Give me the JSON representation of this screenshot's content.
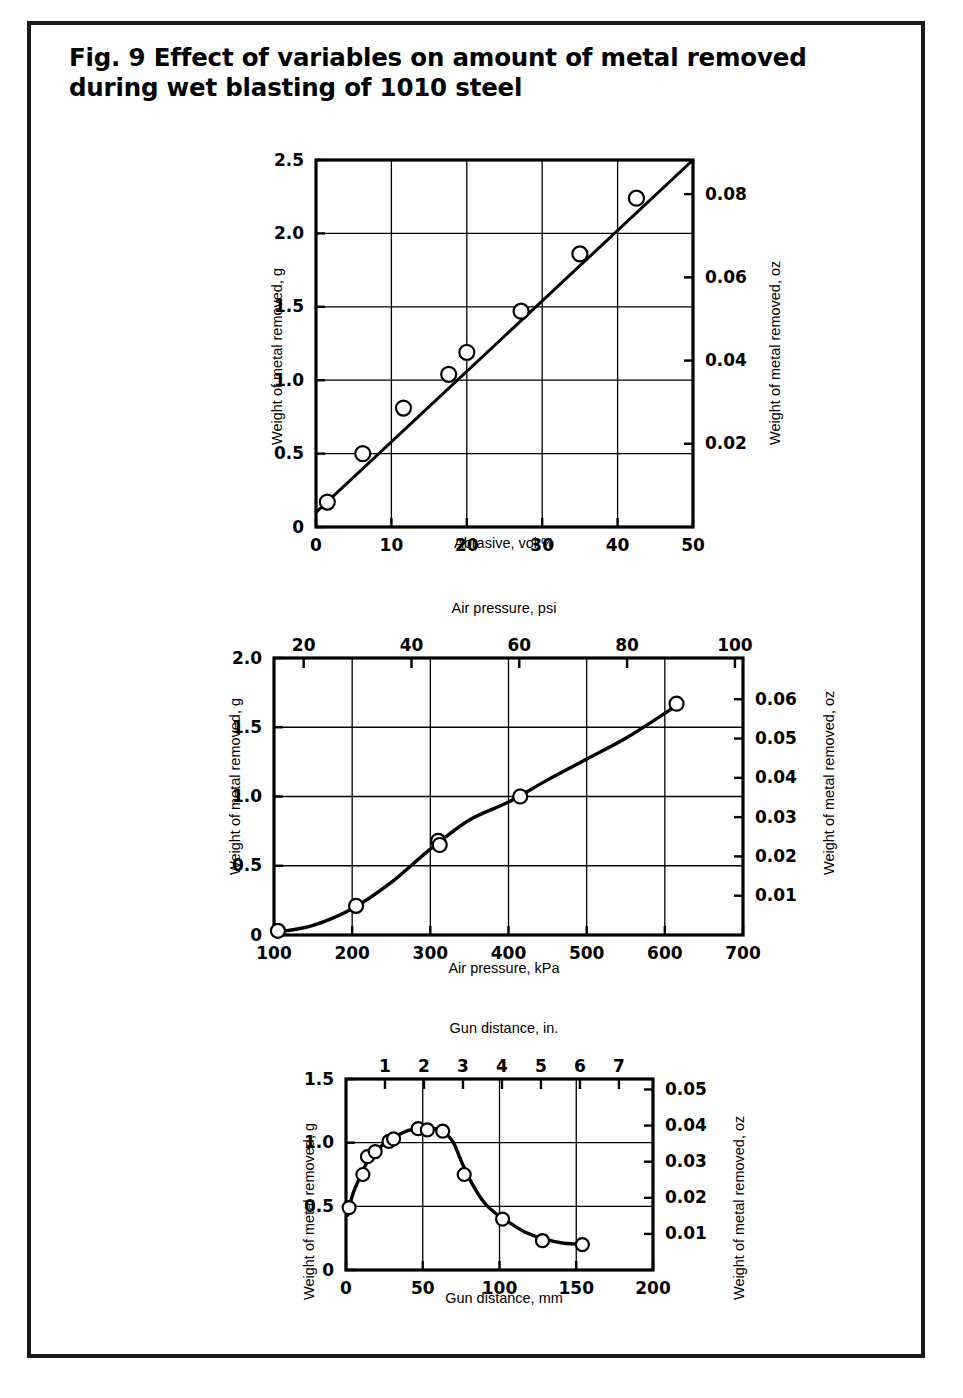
{
  "figure": {
    "title": "Fig. 9 Effect of variables on amount of metal removed during wet blasting of 1010 steel",
    "title_line1": "Fig. 9 Effect of variables on amount of metal removed",
    "title_line2": "during wet blasting of 1010 steel"
  },
  "chart_data": [
    {
      "type": "line",
      "id": "abrasive-chart",
      "title": "",
      "xlabel": "Abrasive, vol %",
      "ylabel": "Weight of metal removed, g",
      "y2label": "Weight of metal removed, oz",
      "xlim": [
        0,
        50
      ],
      "ylim": [
        0,
        2.5
      ],
      "y2lim": [
        0,
        0.0882
      ],
      "xticks": [
        0,
        10,
        20,
        30,
        40,
        50
      ],
      "xtick_labels": [
        "0",
        "10",
        "20",
        "30",
        "40",
        "50"
      ],
      "yticks": [
        0,
        0.5,
        1.0,
        1.5,
        2.0,
        2.5
      ],
      "ytick_labels": [
        "0",
        "0.5",
        "1.0",
        "1.5",
        "2.0",
        "2.5"
      ],
      "y2ticks": [
        0.02,
        0.04,
        0.06,
        0.08
      ],
      "y2tick_labels": [
        "0.02",
        "0.04",
        "0.06",
        "0.08"
      ],
      "grid": true,
      "x": [
        1.5,
        6.2,
        11.6,
        17.6,
        20.0,
        27.2,
        35.0,
        42.5
      ],
      "y": [
        0.17,
        0.5,
        0.81,
        1.04,
        1.19,
        1.47,
        1.86,
        2.24
      ],
      "fit_line": [
        [
          0,
          0.1
        ],
        [
          50,
          2.5
        ]
      ],
      "marker": "open-circle"
    },
    {
      "type": "line",
      "id": "air-pressure-chart",
      "title": "",
      "xlabel": "Air pressure, kPa",
      "xlabel_top": "Air pressure, psi",
      "ylabel": "Weight of metal removed, g",
      "y2label": "Weight of metal removed, oz",
      "xlim": [
        100,
        700
      ],
      "xlim_top": [
        14.5,
        101.5
      ],
      "ylim": [
        0,
        2.0
      ],
      "y2lim": [
        0,
        0.0705
      ],
      "xticks": [
        100,
        200,
        300,
        400,
        500,
        600,
        700
      ],
      "xtick_labels": [
        "100",
        "200",
        "300",
        "400",
        "500",
        "600",
        "700"
      ],
      "xticks_top": [
        20,
        40,
        60,
        80,
        100
      ],
      "xtick_labels_top": [
        "20",
        "40",
        "60",
        "80",
        "100"
      ],
      "yticks": [
        0,
        0.5,
        1.0,
        1.5,
        2.0
      ],
      "ytick_labels": [
        "0",
        "0.5",
        "1.0",
        "1.5",
        "2.0"
      ],
      "y2ticks": [
        0.01,
        0.02,
        0.03,
        0.04,
        0.05,
        0.06
      ],
      "y2tick_labels": [
        "0.01",
        "0.02",
        "0.03",
        "0.04",
        "0.05",
        "0.06"
      ],
      "grid": true,
      "x": [
        105,
        205,
        310,
        312,
        415,
        615
      ],
      "y": [
        0.03,
        0.21,
        0.68,
        0.65,
        1.0,
        1.67
      ],
      "curve": [
        [
          104,
          0.02
        ],
        [
          150,
          0.07
        ],
        [
          200,
          0.19
        ],
        [
          250,
          0.38
        ],
        [
          300,
          0.62
        ],
        [
          350,
          0.83
        ],
        [
          400,
          0.96
        ],
        [
          450,
          1.12
        ],
        [
          500,
          1.27
        ],
        [
          550,
          1.42
        ],
        [
          600,
          1.6
        ],
        [
          617,
          1.67
        ]
      ],
      "marker": "open-circle"
    },
    {
      "type": "line",
      "id": "gun-distance-chart",
      "title": "",
      "xlabel": "Gun distance, mm",
      "xlabel_top": "Gun distance, in.",
      "ylabel": "Weight of metal removed, g",
      "y2label": "Weight of metal removed, oz",
      "xlim": [
        0,
        200
      ],
      "xlim_top": [
        0,
        7.874
      ],
      "ylim": [
        0,
        1.5
      ],
      "y2lim": [
        0,
        0.0529
      ],
      "xticks": [
        0,
        50,
        100,
        150,
        200
      ],
      "xtick_labels": [
        "0",
        "50",
        "100",
        "150",
        "200"
      ],
      "xticks_top": [
        1,
        2,
        3,
        4,
        5,
        6,
        7
      ],
      "xtick_labels_top": [
        "1",
        "2",
        "3",
        "4",
        "5",
        "6",
        "7"
      ],
      "yticks": [
        0,
        0.5,
        1.0,
        1.5
      ],
      "ytick_labels": [
        "0",
        "0.5",
        "1.0",
        "1.5"
      ],
      "y2ticks": [
        0.01,
        0.02,
        0.03,
        0.04,
        0.05
      ],
      "y2tick_labels": [
        "0.01",
        "0.02",
        "0.03",
        "0.04",
        "0.05"
      ],
      "grid": true,
      "x": [
        2,
        11,
        14,
        19,
        28,
        31,
        47,
        53,
        63,
        77,
        102,
        128,
        154
      ],
      "y": [
        0.49,
        0.75,
        0.89,
        0.93,
        1.01,
        1.03,
        1.11,
        1.1,
        1.09,
        0.75,
        0.4,
        0.23,
        0.2
      ],
      "curve": [
        [
          1,
          0.43
        ],
        [
          4,
          0.58
        ],
        [
          8,
          0.7
        ],
        [
          13,
          0.83
        ],
        [
          19,
          0.93
        ],
        [
          26,
          1.0
        ],
        [
          34,
          1.06
        ],
        [
          42,
          1.1
        ],
        [
          50,
          1.11
        ],
        [
          58,
          1.11
        ],
        [
          65,
          1.07
        ],
        [
          70,
          1.0
        ],
        [
          76,
          0.83
        ],
        [
          82,
          0.68
        ],
        [
          90,
          0.53
        ],
        [
          98,
          0.44
        ],
        [
          108,
          0.36
        ],
        [
          118,
          0.29
        ],
        [
          130,
          0.24
        ],
        [
          142,
          0.21
        ],
        [
          156,
          0.2
        ]
      ],
      "marker": "open-circle"
    }
  ]
}
